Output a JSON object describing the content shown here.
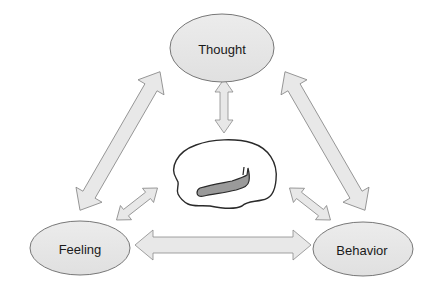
{
  "diagram": {
    "nodes": [
      {
        "id": "thought",
        "label": "Thought",
        "cx": 222,
        "cy": 48,
        "rx": 52,
        "ry": 34
      },
      {
        "id": "feeling",
        "label": "Feeling",
        "cx": 80,
        "cy": 248,
        "rx": 50,
        "ry": 27
      },
      {
        "id": "behavior",
        "label": "Behavior",
        "cx": 363,
        "cy": 249,
        "rx": 50,
        "ry": 27
      }
    ],
    "center_image": "brain-icon",
    "edges": [
      {
        "from": "thought",
        "to": "feeling",
        "type": "bidirectional"
      },
      {
        "from": "thought",
        "to": "behavior",
        "type": "bidirectional"
      },
      {
        "from": "feeling",
        "to": "behavior",
        "type": "bidirectional"
      },
      {
        "from": "thought",
        "to": "brain",
        "type": "bidirectional"
      },
      {
        "from": "feeling",
        "to": "brain",
        "type": "bidirectional"
      },
      {
        "from": "behavior",
        "to": "brain",
        "type": "bidirectional"
      }
    ],
    "colors": {
      "node_fill": "#e6e6e6",
      "node_stroke": "#777777",
      "arrow_fill": "#e8e8e8",
      "arrow_stroke": "#8a8a8a",
      "brain_stroke": "#2a2a2a",
      "brain_region": "#9a9a9a"
    }
  }
}
